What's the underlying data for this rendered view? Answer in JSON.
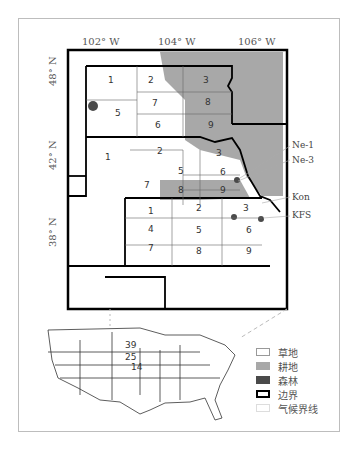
{
  "axes": {
    "longitude_labels": [
      "102° W",
      "104° W",
      "106° W"
    ],
    "latitude_labels": [
      "48° N",
      "42° N",
      "38° N"
    ]
  },
  "regions": {
    "north_dakota": [
      "1",
      "2",
      "3",
      "5",
      "6",
      "7",
      "8",
      "9"
    ],
    "nebraska": [
      "1",
      "2",
      "3",
      "5",
      "6",
      "7",
      "8",
      "9"
    ],
    "kansas": [
      "1",
      "2",
      "3",
      "4",
      "5",
      "6",
      "7",
      "8",
      "9"
    ]
  },
  "sites": [
    "Ne-1",
    "Ne-3",
    "Kon",
    "KFS"
  ],
  "inset_map": {
    "state_labels": [
      "39",
      "25",
      "14"
    ]
  },
  "legend": {
    "items": [
      {
        "label": "草地",
        "color": "#ffffff"
      },
      {
        "label": "耕地",
        "color": "#a8a8a8"
      },
      {
        "label": "森林",
        "color": "#4a4a4a"
      },
      {
        "label": "边界",
        "color": "#000000"
      },
      {
        "label": "气候界线",
        "color": "#f4f4f4"
      }
    ]
  },
  "colors": {
    "cropland": "#a8a8a8",
    "forest": "#4a4a4a",
    "grassland": "#ffffff"
  }
}
